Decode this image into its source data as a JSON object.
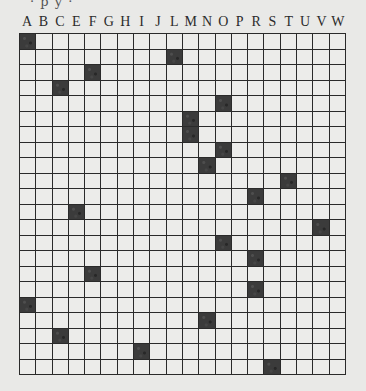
{
  "puzzle": {
    "cut_off_header_text": "· p y ·",
    "columns": [
      "A",
      "B",
      "C",
      "E",
      "F",
      "G",
      "H",
      "I",
      "J",
      "L",
      "M",
      "N",
      "O",
      "P",
      "R",
      "S",
      "T",
      "U",
      "V",
      "W"
    ],
    "row_count": 22,
    "filled_cells": [
      {
        "row": 0,
        "col": "A"
      },
      {
        "row": 1,
        "col": "L"
      },
      {
        "row": 2,
        "col": "F"
      },
      {
        "row": 3,
        "col": "C"
      },
      {
        "row": 4,
        "col": "O"
      },
      {
        "row": 5,
        "col": "M"
      },
      {
        "row": 6,
        "col": "M"
      },
      {
        "row": 7,
        "col": "O"
      },
      {
        "row": 8,
        "col": "N"
      },
      {
        "row": 9,
        "col": "T"
      },
      {
        "row": 10,
        "col": "R"
      },
      {
        "row": 11,
        "col": "E"
      },
      {
        "row": 12,
        "col": "V"
      },
      {
        "row": 13,
        "col": "O"
      },
      {
        "row": 14,
        "col": "R"
      },
      {
        "row": 15,
        "col": "F"
      },
      {
        "row": 16,
        "col": "R"
      },
      {
        "row": 17,
        "col": "A"
      },
      {
        "row": 18,
        "col": "N"
      },
      {
        "row": 19,
        "col": "C"
      },
      {
        "row": 20,
        "col": "I"
      },
      {
        "row": 21,
        "col": "S"
      }
    ],
    "colors": {
      "background": "#e9e9e7",
      "cell": "#ececea",
      "filled": "#3b3b3b",
      "grid_line": "#2a2a2a",
      "letter": "#2b2b2b"
    }
  }
}
